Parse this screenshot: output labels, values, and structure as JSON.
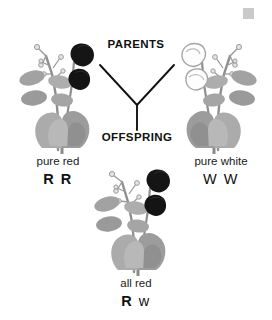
{
  "diagram": {
    "title_parents": "PARENTS",
    "title_offspring": "OFFSPRING",
    "background_color": "#ffffff",
    "line_color": "#111111",
    "leaf_color": "#9a9a9a",
    "leaf_color_dark": "#7d7d7d",
    "leaf_color_light": "#b3b3b3",
    "stem_color": "#8c8c8c",
    "red_flower_color": "#121212",
    "white_flower_color": "#fdfdfd",
    "white_flower_outline": "#a8a8a8"
  },
  "corner_marker": {
    "name": "gray-square-marker",
    "color": "#c9c9c9"
  },
  "parents": [
    {
      "id": "parent-left",
      "phenotype": "pure red",
      "genotype": "R R",
      "alleles": [
        {
          "symbol": "R",
          "type": "dominant"
        },
        {
          "symbol": "R",
          "type": "dominant"
        }
      ],
      "flower_color": "red",
      "plant_icon": "pea-plant-red-flowers"
    },
    {
      "id": "parent-right",
      "phenotype": "pure white",
      "genotype": "W W",
      "alleles": [
        {
          "symbol": "W",
          "type": "recessive"
        },
        {
          "symbol": "W",
          "type": "recessive"
        }
      ],
      "flower_color": "white",
      "plant_icon": "pea-plant-white-flowers"
    }
  ],
  "offspring": {
    "id": "offspring",
    "phenotype": "all red",
    "genotype": "R w",
    "alleles": [
      {
        "symbol": "R",
        "type": "dominant"
      },
      {
        "symbol": "w",
        "type": "recessive"
      }
    ],
    "flower_color": "red",
    "plant_icon": "pea-plant-red-flowers"
  }
}
